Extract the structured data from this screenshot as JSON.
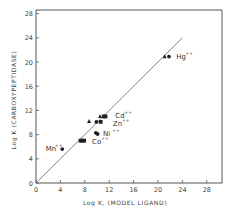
{
  "chart_data": {
    "type": "scatter",
    "title": "",
    "xlabel": "Log K, (MODEL LIGAND)",
    "ylabel": "Log K (CARBOXYPEPTIDASE)",
    "xlim": [
      0,
      30
    ],
    "ylim": [
      0,
      30
    ],
    "xticks": [
      0,
      4,
      8,
      12,
      16,
      20,
      24,
      28
    ],
    "yticks": [
      0,
      4,
      8,
      12,
      16,
      20,
      24,
      28
    ],
    "grid": false,
    "reference_line": {
      "label": "identity line y = x",
      "from": [
        0,
        0
      ],
      "to": [
        24,
        24
      ]
    },
    "series": [
      {
        "name": "triangles",
        "marker": "triangle",
        "points": [
          {
            "x": 8.7,
            "y": 10.2
          },
          {
            "x": 10.5,
            "y": 11.0
          },
          {
            "x": 21.1,
            "y": 20.9
          }
        ]
      },
      {
        "name": "circles",
        "marker": "circle",
        "points": [
          {
            "x": 4.3,
            "y": 5.6
          },
          {
            "x": 9.8,
            "y": 8.3
          },
          {
            "x": 10.1,
            "y": 8.1
          },
          {
            "x": 9.9,
            "y": 10.1
          },
          {
            "x": 21.8,
            "y": 20.9
          }
        ]
      },
      {
        "name": "squares",
        "marker": "square",
        "points": [
          {
            "x": 7.3,
            "y": 7.0
          },
          {
            "x": 7.6,
            "y": 7.0
          },
          {
            "x": 7.9,
            "y": 7.0
          },
          {
            "x": 10.6,
            "y": 10.1
          },
          {
            "x": 11.1,
            "y": 11.0
          },
          {
            "x": 11.4,
            "y": 11.0
          }
        ]
      }
    ],
    "annotations": [
      {
        "text": "Mn",
        "sup": "++",
        "x": 1.6,
        "y": 5.3
      },
      {
        "text": "Co",
        "sup": "++",
        "x": 9.2,
        "y": 6.4
      },
      {
        "text": "Ni",
        "sup": "++",
        "x": 11.0,
        "y": 7.8
      },
      {
        "text": "Zn",
        "sup": "++",
        "x": 12.6,
        "y": 9.4
      },
      {
        "text": "Cd",
        "sup": "++",
        "x": 13.0,
        "y": 10.8
      },
      {
        "text": "Hg",
        "sup": "++",
        "x": 23.0,
        "y": 20.5
      }
    ]
  }
}
